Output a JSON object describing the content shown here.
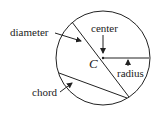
{
  "diagram": {
    "labels": {
      "diameter": "diameter",
      "center": "center",
      "center_point": "C",
      "radius": "radius",
      "chord": "chord"
    },
    "colors": {
      "stroke": "#222222",
      "background": "#ffffff"
    }
  }
}
